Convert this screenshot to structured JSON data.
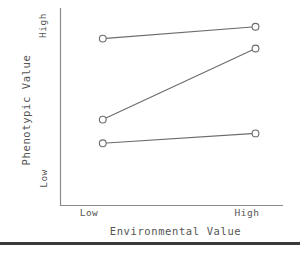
{
  "chart_data": {
    "type": "line",
    "title": "",
    "xlabel": "Environmental Value",
    "ylabel": "Phenotypic Value",
    "xtick_labels": [
      "Low",
      "High"
    ],
    "ytick_labels": [
      "Low",
      "High"
    ],
    "x": [
      0,
      1
    ],
    "xlim": [
      -0.28,
      1.18
    ],
    "ylim": [
      0,
      1
    ],
    "grid": false,
    "legend": "none",
    "marker": "open-circle",
    "line_color": "#6b6b6b",
    "marker_edge_color": "#6b6b6b",
    "marker_face_color": "#ffffff",
    "series": [
      {
        "name": "genotype-1",
        "values": [
          0.845,
          0.905
        ]
      },
      {
        "name": "genotype-2",
        "values": [
          0.435,
          0.795
        ]
      },
      {
        "name": "genotype-3",
        "values": [
          0.315,
          0.365
        ]
      }
    ]
  },
  "figure": {
    "axis_color": "#8a8a8a",
    "text_color": "#555555",
    "background": "#ffffff",
    "rule_color": "#3a3a3a"
  }
}
